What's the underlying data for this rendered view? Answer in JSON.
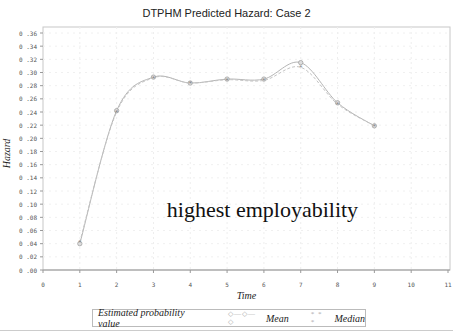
{
  "chart_data": {
    "type": "line",
    "title": "DTPHM Predicted Hazard: Case 2",
    "xlabel": "Time",
    "ylabel": "Hazard",
    "x": [
      1,
      2,
      3,
      4,
      5,
      6,
      7,
      8,
      9
    ],
    "series": [
      {
        "name": "Mean",
        "values": [
          0.04,
          0.242,
          0.293,
          0.284,
          0.29,
          0.29,
          0.315,
          0.254,
          0.219
        ]
      },
      {
        "name": "Median",
        "values": [
          0.043,
          0.24,
          0.292,
          0.284,
          0.289,
          0.288,
          0.308,
          0.252,
          0.219
        ]
      }
    ],
    "xlim": [
      0,
      11
    ],
    "ylim": [
      0,
      0.36
    ],
    "xticks": [
      "0",
      "1",
      "2",
      "3",
      "4",
      "5",
      "6",
      "7",
      "8",
      "9",
      "10",
      "11"
    ],
    "yticks": [
      "0.00",
      "0.02",
      "0.04",
      "0.06",
      "0.08",
      "0.10",
      "0.12",
      "0.14",
      "0.16",
      "0.18",
      "0.20",
      "0.22",
      "0.24",
      "0.26",
      "0.28",
      "0.30",
      "0.32",
      "0.34",
      "0.36"
    ],
    "grid": true,
    "legend_position": "bottom",
    "annotations": [
      "highest employability"
    ]
  },
  "header": {
    "title": "DTPHM Predicted Hazard: Case 2"
  },
  "annotation": "highest employability",
  "axes": {
    "xlabel": "Time",
    "ylabel": "Hazard"
  },
  "legend": {
    "title": "Estimated probability value",
    "mean_symbol": "◇—◇—◇",
    "mean_label": "Mean",
    "median_symbol": "* * *",
    "median_label": "Median"
  }
}
